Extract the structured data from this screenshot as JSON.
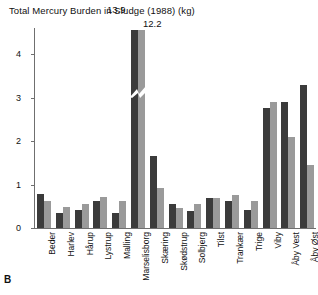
{
  "figure": {
    "panel_letter": "B",
    "title": "Total Mercury Burden in Sludge (1988) (kg)"
  },
  "axis": {
    "y_ticks": [
      "0",
      "1",
      "2",
      "3",
      "4"
    ],
    "y_tick_values": [
      0,
      1,
      2,
      3,
      4
    ]
  },
  "annotations": [
    {
      "text": "13.9",
      "series": "series1",
      "category": "Marselisborg"
    },
    {
      "text": "12.2",
      "series": "series2",
      "category": "Marselisborg"
    }
  ],
  "colors": {
    "series1": "#3b3b3b",
    "series2": "#9a9a9a",
    "axis": "#6f6f6f",
    "background": "#ffffff",
    "text": "#111111"
  },
  "chart_data": {
    "type": "bar",
    "title": "Total Mercury Burden in Sludge (1988) (kg)",
    "xlabel": "",
    "ylabel": "",
    "ylim": [
      0,
      4.6
    ],
    "grid": false,
    "legend": "none",
    "axis_break": {
      "applies_to": "Marselisborg",
      "note": "bars truncated with zigzag break; true values shown as data labels"
    },
    "categories": [
      "Beder",
      "Harlev",
      "Hårup",
      "Lystrup",
      "Malling",
      "Marselisborg",
      "Skæring",
      "Skødstrup",
      "Solbjerg",
      "Tilst",
      "Trankær",
      "Trige",
      "Viby",
      "Åby Vest",
      "Åby Øst"
    ],
    "series": [
      {
        "name": "series1",
        "color": "#3b3b3b",
        "values": [
          0.78,
          0.35,
          0.42,
          0.62,
          0.35,
          13.9,
          1.65,
          0.55,
          0.38,
          0.68,
          0.62,
          0.42,
          2.75,
          2.9,
          3.3
        ]
      },
      {
        "name": "series2",
        "color": "#9a9a9a",
        "values": [
          0.62,
          0.48,
          0.55,
          0.72,
          0.62,
          12.2,
          0.92,
          0.45,
          0.55,
          0.7,
          0.75,
          0.62,
          2.9,
          2.1,
          1.45
        ]
      }
    ]
  }
}
